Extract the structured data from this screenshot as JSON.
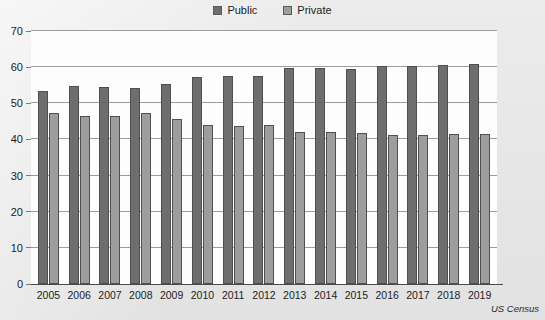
{
  "legend": {
    "entries": [
      {
        "label": "Public",
        "color": "#6e6e6e"
      },
      {
        "label": "Private",
        "color": "#9d9d9d"
      }
    ]
  },
  "source": {
    "text": "US Census"
  },
  "chart_data": {
    "type": "bar",
    "title": "",
    "subtitle": "",
    "xlabel": "",
    "ylabel": "",
    "ylim": [
      0,
      70
    ],
    "yticks": [
      0,
      10,
      20,
      30,
      40,
      50,
      60,
      70
    ],
    "ytick_labels": [
      "0",
      "10",
      "20",
      "30",
      "40",
      "50",
      "60",
      "70"
    ],
    "grid": true,
    "legend_position": "top-center",
    "categories": [
      "2005",
      "2006",
      "2007",
      "2008",
      "2009",
      "2010",
      "2011",
      "2012",
      "2013",
      "2014",
      "2015",
      "2016",
      "2017",
      "2018",
      "2019"
    ],
    "series": [
      {
        "name": "Public",
        "color": "#6e6e6e",
        "values": [
          53.5,
          54.8,
          54.6,
          54.1,
          55.3,
          57.2,
          57.6,
          57.6,
          59.7,
          59.8,
          59.6,
          60.2,
          60.4,
          60.7,
          60.8
        ]
      },
      {
        "name": "Private",
        "color": "#9d9d9d",
        "values": [
          47.2,
          46.4,
          46.4,
          47.2,
          45.6,
          44.1,
          43.8,
          43.9,
          42.1,
          42.0,
          41.8,
          41.2,
          41.2,
          41.4,
          41.4
        ]
      }
    ],
    "annotations": [
      "US Census"
    ]
  }
}
